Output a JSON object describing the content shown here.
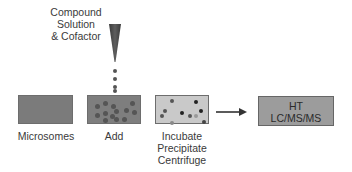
{
  "diagram": {
    "type": "workflow",
    "compound": {
      "lines": [
        "Compound",
        "Solution",
        "& Cofactor"
      ]
    },
    "steps": [
      {
        "id": "microsomes",
        "label_lines": [
          "Microsomes"
        ],
        "fill": "#7a7a7a"
      },
      {
        "id": "add",
        "label_lines": [
          "Add"
        ],
        "fill": "#7e7e7e"
      },
      {
        "id": "incubate",
        "label_lines": [
          "Incubate",
          "Precipitate",
          "Centrifuge"
        ],
        "fill": "#c8c8c8"
      },
      {
        "id": "analysis",
        "box_lines": [
          "HT",
          "LC/MS/MS"
        ],
        "fill": "#9a9a9a"
      }
    ],
    "arrow": {
      "from": "incubate",
      "to": "analysis"
    },
    "colors": {
      "dropper": "#4a4a4a",
      "dot_dark": "#3a3a3a",
      "dot_mid": "#5a5a5a",
      "dot_light": "#8a8a8a"
    }
  }
}
